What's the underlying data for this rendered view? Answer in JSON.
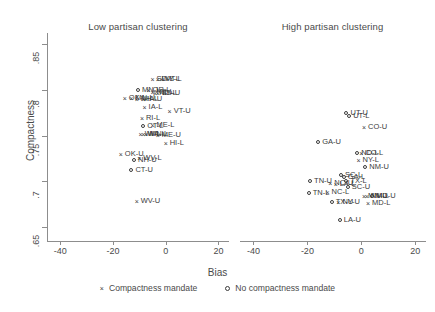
{
  "chart_data": {
    "type": "scatter",
    "title": "",
    "xlabel": "Bias",
    "ylabel": "Compactness",
    "xlim": [
      -45,
      24
    ],
    "ylim": [
      0.635,
      0.862
    ],
    "xticks": [
      "-40",
      "-20",
      "0",
      "20"
    ],
    "xtick_values": [
      -40,
      -20,
      0,
      20
    ],
    "yticks": [
      ".85",
      ".8",
      ".75",
      ".7",
      ".65"
    ],
    "ytick_values": [
      0.85,
      0.8,
      0.75,
      0.7,
      0.65
    ],
    "grid": false,
    "legend_position": "bottom",
    "legend": [
      {
        "marker": "x",
        "label": "Compactness mandate"
      },
      {
        "marker": "o",
        "label": "No compactness mandate"
      }
    ],
    "panels": [
      {
        "title": "Low partisan clustering",
        "points": [
          {
            "label": "SD-L",
            "x": -5.0,
            "y": 0.812,
            "marker": "x"
          },
          {
            "label": "WY-L",
            "x": -3.0,
            "y": 0.812,
            "marker": "x"
          },
          {
            "label": "VT-L",
            "x": -1.5,
            "y": 0.812,
            "marker": "x"
          },
          {
            "label": "MN-L",
            "x": -10.5,
            "y": 0.8,
            "marker": "o"
          },
          {
            "label": "OR-L",
            "x": -6.5,
            "y": 0.8,
            "marker": "x"
          },
          {
            "label": "NE-L",
            "x": -5.0,
            "y": 0.798,
            "marker": "x"
          },
          {
            "label": "ND-L",
            "x": -4.0,
            "y": 0.797,
            "marker": "x"
          },
          {
            "label": "SD-U",
            "x": -3.0,
            "y": 0.796,
            "marker": "x"
          },
          {
            "label": "OK-L",
            "x": -15.5,
            "y": 0.791,
            "marker": "x"
          },
          {
            "label": "MN-U",
            "x": -13.0,
            "y": 0.791,
            "marker": "x"
          },
          {
            "label": "NH-L",
            "x": -11.0,
            "y": 0.79,
            "marker": "x"
          },
          {
            "label": "IA-U",
            "x": -8.5,
            "y": 0.79,
            "marker": "x"
          },
          {
            "label": "IA-L",
            "x": -8.0,
            "y": 0.781,
            "marker": "x"
          },
          {
            "label": "VT-U",
            "x": 1.5,
            "y": 0.777,
            "marker": "x"
          },
          {
            "label": "RI-L",
            "x": -9.0,
            "y": 0.769,
            "marker": "x"
          },
          {
            "label": "CT-L",
            "x": -8.5,
            "y": 0.76,
            "marker": "o"
          },
          {
            "label": "ME-L",
            "x": -5.0,
            "y": 0.762,
            "marker": "x"
          },
          {
            "label": "WI-L",
            "x": -9.5,
            "y": 0.752,
            "marker": "x"
          },
          {
            "label": "WA-L",
            "x": -8.5,
            "y": 0.752,
            "marker": "x"
          },
          {
            "label": "MN-L2",
            "x": -7.5,
            "y": 0.752,
            "marker": "x"
          },
          {
            "label": "ME-U",
            "x": -3.0,
            "y": 0.751,
            "marker": "x"
          },
          {
            "label": "HI-L",
            "x": 0.0,
            "y": 0.742,
            "marker": "x"
          },
          {
            "label": "OK-U",
            "x": -17.0,
            "y": 0.73,
            "marker": "x"
          },
          {
            "label": "NH-U",
            "x": -12.0,
            "y": 0.723,
            "marker": "o"
          },
          {
            "label": "WV-L",
            "x": -10.0,
            "y": 0.726,
            "marker": "x"
          },
          {
            "label": "CT-U",
            "x": -13.0,
            "y": 0.713,
            "marker": "o"
          },
          {
            "label": "WV-U",
            "x": -11.0,
            "y": 0.679,
            "marker": "x"
          }
        ]
      },
      {
        "title": "High partisan clustering",
        "points": [
          {
            "label": "UT-U",
            "x": -5.5,
            "y": 0.775,
            "marker": "o"
          },
          {
            "label": "UT-L",
            "x": -4.5,
            "y": 0.771,
            "marker": "o"
          },
          {
            "label": "CO-U",
            "x": 1.0,
            "y": 0.759,
            "marker": "x"
          },
          {
            "label": "GA-U",
            "x": -16.0,
            "y": 0.743,
            "marker": "o"
          },
          {
            "label": "ND-L",
            "x": -1.5,
            "y": 0.731,
            "marker": "o"
          },
          {
            "label": "CO-L",
            "x": 0.0,
            "y": 0.731,
            "marker": "x"
          },
          {
            "label": "NY-L",
            "x": -1.0,
            "y": 0.723,
            "marker": "x"
          },
          {
            "label": "NM-U",
            "x": 1.5,
            "y": 0.716,
            "marker": "o"
          },
          {
            "label": "SC-L",
            "x": -7.5,
            "y": 0.707,
            "marker": "o"
          },
          {
            "label": "GA-L",
            "x": -6.5,
            "y": 0.705,
            "marker": "o"
          },
          {
            "label": "TN-U",
            "x": -19.0,
            "y": 0.7,
            "marker": "o"
          },
          {
            "label": "NC-U",
            "x": -11.5,
            "y": 0.698,
            "marker": "x"
          },
          {
            "label": "LA-L",
            "x": -9.5,
            "y": 0.697,
            "marker": "x"
          },
          {
            "label": "TX-L",
            "x": -5.5,
            "y": 0.7,
            "marker": "o"
          },
          {
            "label": "SC-U",
            "x": -5.0,
            "y": 0.694,
            "marker": "o"
          },
          {
            "label": "TN-L",
            "x": -19.5,
            "y": 0.687,
            "marker": "o"
          },
          {
            "label": "NC-L",
            "x": -12.5,
            "y": 0.688,
            "marker": "x"
          },
          {
            "label": "MN-U",
            "x": 1.0,
            "y": 0.684,
            "marker": "x"
          },
          {
            "label": "NM-L",
            "x": 2.0,
            "y": 0.684,
            "marker": "x"
          },
          {
            "label": "MD-U",
            "x": 4.0,
            "y": 0.684,
            "marker": "o"
          },
          {
            "label": "TX-U",
            "x": -11.0,
            "y": 0.678,
            "marker": "o"
          },
          {
            "label": "NY-U",
            "x": -8.5,
            "y": 0.678,
            "marker": "x"
          },
          {
            "label": "MD-L",
            "x": 2.5,
            "y": 0.676,
            "marker": "x"
          },
          {
            "label": "LA-U",
            "x": -8.0,
            "y": 0.658,
            "marker": "o"
          }
        ]
      }
    ]
  }
}
